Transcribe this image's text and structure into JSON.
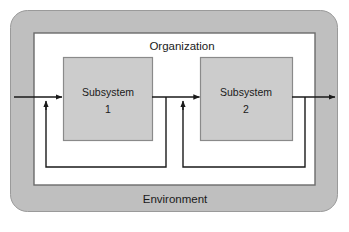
{
  "diagram": {
    "outer_label": "Environment",
    "inner_label": "Organization",
    "colors": {
      "environment_fill": "#bfbfbf",
      "environment_stroke": "#9a9a9a",
      "organization_fill": "#ffffff",
      "organization_stroke": "#6b6b6b",
      "subsystem_fill": "#cccccc",
      "subsystem_stroke": "#8a8a8a",
      "arrow_stroke": "#1a1a1a",
      "page_background": "#ffffff"
    },
    "nodes": [
      {
        "id": "subsystem-1",
        "name_line1": "Subsystem",
        "name_line2": "1"
      },
      {
        "id": "subsystem-2",
        "name_line1": "Subsystem",
        "name_line2": "2"
      }
    ],
    "connections": [
      {
        "id": "input-arrow",
        "from": "environment",
        "to": "subsystem-1",
        "kind": "input"
      },
      {
        "id": "subsystem-1-to-2",
        "from": "subsystem-1",
        "to": "subsystem-2",
        "kind": "flow"
      },
      {
        "id": "output-arrow",
        "from": "subsystem-2",
        "to": "environment",
        "kind": "output"
      },
      {
        "id": "feedback-1",
        "from": "subsystem-1",
        "to": "subsystem-1",
        "kind": "feedback"
      },
      {
        "id": "feedback-2",
        "from": "subsystem-2",
        "to": "subsystem-2",
        "kind": "feedback"
      }
    ]
  }
}
